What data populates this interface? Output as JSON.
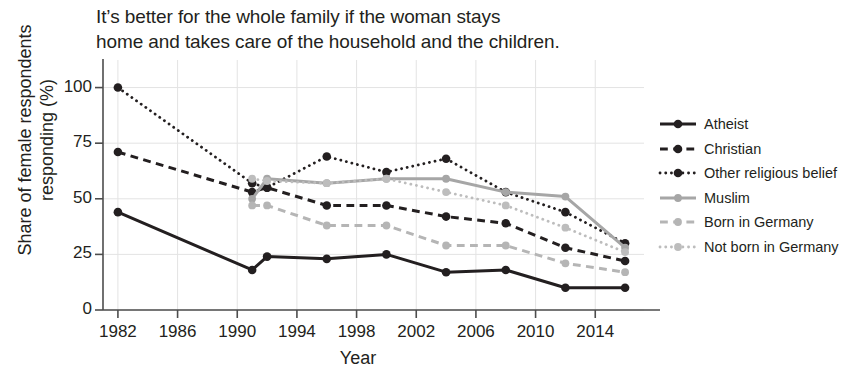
{
  "title": "It’s better for the whole family if the woman stays home and takes care of the household and the children.",
  "title_line1": "It’s better for the whole family if the woman stays",
  "title_line2": "home and takes care of the household and the children.",
  "axes": {
    "ylabel_line1": "Share of female respondents",
    "ylabel_line2": "responding (%)",
    "xlabel": "Year",
    "yticks": [
      "0",
      "25",
      "50",
      "75",
      "100"
    ],
    "xticks": [
      "1982",
      "1986",
      "1990",
      "1994",
      "1998",
      "2002",
      "2006",
      "2010",
      "2014"
    ]
  },
  "legend": {
    "items": [
      {
        "label": "Atheist",
        "color": "#231f20",
        "style": "solid"
      },
      {
        "label": "Christian",
        "color": "#231f20",
        "style": "dashed"
      },
      {
        "label": "Other religious belief",
        "color": "#231f20",
        "style": "dotted"
      },
      {
        "label": "Muslim",
        "color": "#a6a6a6",
        "style": "solid"
      },
      {
        "label": "Born in Germany",
        "color": "#b5b5b5",
        "style": "dashed"
      },
      {
        "label": "Not born in Germany",
        "color": "#bdbdbd",
        "style": "dotted"
      }
    ]
  },
  "colors": {
    "black": "#231f20",
    "gray_muslim": "#a6a6a6",
    "gray_born": "#b5b5b5",
    "gray_notborn": "#bdbdbd",
    "grid": "#e3e3e3",
    "axis": "#4d4d4d"
  },
  "chart_data": {
    "type": "line",
    "title": "It’s better for the whole family if the woman stays home and takes care of the household and the children.",
    "xlabel": "Year",
    "ylabel": "Share of female respondents responding (%)",
    "xlim": [
      1981,
      2017
    ],
    "ylim": [
      0,
      107
    ],
    "yticks": [
      0,
      25,
      50,
      75,
      100
    ],
    "xticks": [
      1982,
      1986,
      1990,
      1994,
      1998,
      2002,
      2006,
      2010,
      2014
    ],
    "grid": true,
    "legend_position": "right",
    "series": [
      {
        "name": "Atheist",
        "color": "#231f20",
        "style": "solid",
        "points": [
          {
            "x": 1982,
            "y": 44
          },
          {
            "x": 1991,
            "y": 18
          },
          {
            "x": 1992,
            "y": 24
          },
          {
            "x": 1996,
            "y": 23
          },
          {
            "x": 2000,
            "y": 25
          },
          {
            "x": 2004,
            "y": 17
          },
          {
            "x": 2008,
            "y": 18
          },
          {
            "x": 2012,
            "y": 10
          },
          {
            "x": 2016,
            "y": 10
          }
        ]
      },
      {
        "name": "Christian",
        "color": "#231f20",
        "style": "dashed",
        "points": [
          {
            "x": 1982,
            "y": 71
          },
          {
            "x": 1991,
            "y": 53
          },
          {
            "x": 1992,
            "y": 55
          },
          {
            "x": 1996,
            "y": 47
          },
          {
            "x": 2000,
            "y": 47
          },
          {
            "x": 2004,
            "y": 42
          },
          {
            "x": 2008,
            "y": 39
          },
          {
            "x": 2012,
            "y": 28
          },
          {
            "x": 2016,
            "y": 22
          }
        ]
      },
      {
        "name": "Other religious belief",
        "color": "#231f20",
        "style": "dotted",
        "points": [
          {
            "x": 1982,
            "y": 100
          },
          {
            "x": 1991,
            "y": 57
          },
          {
            "x": 1992,
            "y": 55
          },
          {
            "x": 1996,
            "y": 69
          },
          {
            "x": 2000,
            "y": 62
          },
          {
            "x": 2004,
            "y": 68
          },
          {
            "x": 2008,
            "y": 53
          },
          {
            "x": 2012,
            "y": 44
          },
          {
            "x": 2016,
            "y": 30
          }
        ]
      },
      {
        "name": "Muslim",
        "color": "#a6a6a6",
        "style": "solid",
        "points": [
          {
            "x": 1991,
            "y": 50
          },
          {
            "x": 1992,
            "y": 59
          },
          {
            "x": 1996,
            "y": 57
          },
          {
            "x": 2000,
            "y": 59
          },
          {
            "x": 2004,
            "y": 59
          },
          {
            "x": 2008,
            "y": 53
          },
          {
            "x": 2012,
            "y": 51
          },
          {
            "x": 2016,
            "y": 28
          }
        ]
      },
      {
        "name": "Born in Germany",
        "color": "#b5b5b5",
        "style": "dashed",
        "points": [
          {
            "x": 1991,
            "y": 47
          },
          {
            "x": 1992,
            "y": 47
          },
          {
            "x": 1996,
            "y": 38
          },
          {
            "x": 2000,
            "y": 38
          },
          {
            "x": 2004,
            "y": 29
          },
          {
            "x": 2008,
            "y": 29
          },
          {
            "x": 2012,
            "y": 21
          },
          {
            "x": 2016,
            "y": 17
          }
        ]
      },
      {
        "name": "Not born in Germany",
        "color": "#bdbdbd",
        "style": "dotted",
        "points": [
          {
            "x": 1991,
            "y": 59
          },
          {
            "x": 1992,
            "y": 58
          },
          {
            "x": 1996,
            "y": 57
          },
          {
            "x": 2000,
            "y": 59
          },
          {
            "x": 2004,
            "y": 53
          },
          {
            "x": 2008,
            "y": 47
          },
          {
            "x": 2012,
            "y": 37
          },
          {
            "x": 2016,
            "y": 26
          }
        ]
      }
    ]
  }
}
